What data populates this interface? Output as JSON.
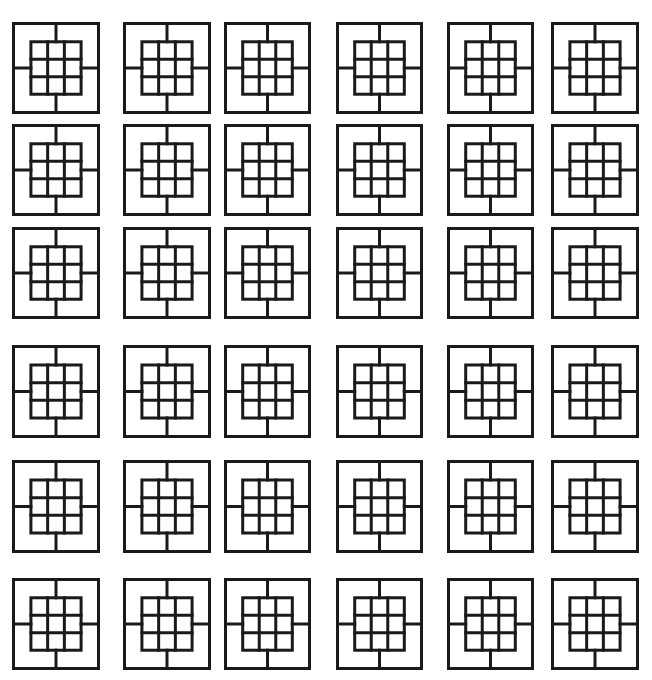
{
  "canvas": {
    "width": 652,
    "height": 680,
    "background": "#ffffff"
  },
  "style": {
    "stroke": "#1a1a1a",
    "stroke_width": 3
  },
  "tile_pattern": {
    "description": "outer square with centered 3x3 grid and four connector lines",
    "outer": 88,
    "inner_offset": 19,
    "inner_size": 50,
    "grid_divisions": 3
  },
  "columns_x": [
    12,
    123,
    224,
    336,
    447,
    551
  ],
  "rows_y": [
    22,
    124,
    227,
    345,
    460,
    578
  ],
  "col_widths": [
    88,
    88,
    87,
    87,
    87,
    88
  ],
  "row_heights": [
    92,
    92,
    92,
    93,
    93,
    92
  ],
  "grid": {
    "rows": 6,
    "cols": 6,
    "tile_count": 36
  }
}
